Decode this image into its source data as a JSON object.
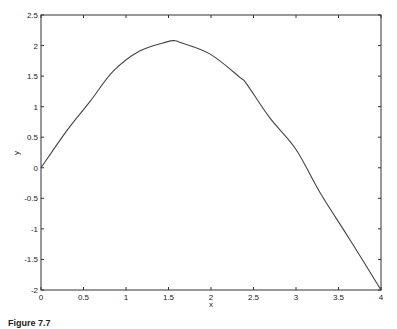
{
  "chart_data": {
    "type": "line",
    "title": "",
    "xlabel": "x",
    "ylabel": "y",
    "xlim": [
      0,
      4
    ],
    "ylim": [
      -2,
      2.5
    ],
    "grid": false,
    "legend": null,
    "x_ticks": [
      "0",
      "0.5",
      "1",
      "1.5",
      "2",
      "2.5",
      "3",
      "3.5",
      "4"
    ],
    "y_ticks": [
      "-2",
      "-1.5",
      "-1",
      "-0.5",
      "0",
      "0.5",
      "1",
      "1.5",
      "2",
      "2.5"
    ],
    "series": [
      {
        "name": "y(x)",
        "color": "#444444",
        "x": [
          0,
          0.3,
          0.58,
          0.85,
          1.16,
          1.48,
          1.57,
          1.64,
          1.99,
          2.34,
          2.42,
          2.69,
          3.0,
          3.28,
          3.64,
          4.0
        ],
        "y": [
          0,
          0.6,
          1.09,
          1.58,
          1.91,
          2.06,
          2.08,
          2.05,
          1.86,
          1.48,
          1.37,
          0.82,
          0.3,
          -0.4,
          -1.19,
          -2.0
        ]
      }
    ]
  },
  "caption": "Figure 7.7"
}
